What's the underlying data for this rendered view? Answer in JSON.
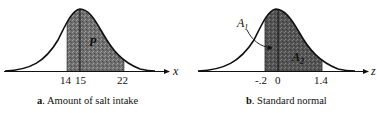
{
  "panels": [
    {
      "id": "a",
      "caption_key": "a",
      "caption_text": ". Amount of salt intake",
      "axis_label": "x",
      "tick_labels": [
        "14",
        "15",
        "22"
      ],
      "area_labels": [
        "P"
      ],
      "shaded_from": "14",
      "shaded_to": "22",
      "mean_line": "15"
    },
    {
      "id": "b",
      "caption_key": "b",
      "caption_text": ". Standard normal",
      "axis_label": "z",
      "tick_labels": [
        "-.2",
        "0",
        "1.4"
      ],
      "area_labels": [
        "A",
        "1",
        "A",
        "2"
      ],
      "shaded_from": "-.2",
      "shaded_to": "1.4",
      "mean_line": "0"
    }
  ],
  "colors": {
    "curve": "#111111",
    "shade": "#6e6e6e",
    "background": "#ffffff"
  }
}
